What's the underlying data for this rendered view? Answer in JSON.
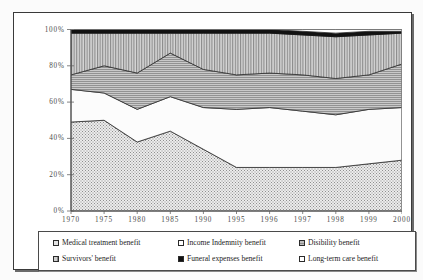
{
  "chart_data": {
    "type": "area",
    "stacked": true,
    "stack_mode": "percent",
    "title": "",
    "xlabel": "",
    "ylabel": "",
    "grid": false,
    "legend_position": "bottom",
    "ylim": [
      0,
      100
    ],
    "ytick_labels": [
      "100%",
      "80%",
      "60%",
      "40%",
      "20%",
      "0%"
    ],
    "ytick_values": [
      100,
      80,
      60,
      40,
      20,
      0
    ],
    "categories": [
      "1970",
      "1975",
      "1980",
      "1985",
      "1990",
      "1995",
      "1996",
      "1997",
      "1998",
      "1999",
      "2000"
    ],
    "series": [
      {
        "name": "Medical treatment benefit",
        "pattern": "fine-dot",
        "color": "#e6e6e6",
        "values": [
          49,
          50,
          38,
          44,
          34,
          24,
          24,
          24,
          24,
          26,
          28
        ]
      },
      {
        "name": "Income Indemnity benefit",
        "pattern": "solid-white",
        "color": "#fbfbfb",
        "values": [
          18,
          15,
          18,
          19,
          23,
          32,
          33,
          31,
          29,
          30,
          29
        ]
      },
      {
        "name": "Disibility benefit",
        "pattern": "horizontal-lines",
        "color": "#b8b8b8",
        "values": [
          8,
          15,
          20,
          24,
          21,
          19,
          19,
          20,
          20,
          19,
          24
        ]
      },
      {
        "name": "Survivors' benefit",
        "pattern": "vertical-lines",
        "color": "#cccccc",
        "values": [
          23,
          18,
          22,
          11,
          20,
          23,
          22,
          22,
          23,
          22,
          17
        ]
      },
      {
        "name": "Funeral expenses benefit",
        "pattern": "solid-black",
        "color": "#121212",
        "values": [
          2,
          2,
          2,
          2,
          2,
          2,
          2,
          2,
          2,
          2,
          1
        ]
      },
      {
        "name": "Long-term care benefit",
        "pattern": "solid-white",
        "color": "#ffffff",
        "values": [
          0,
          0,
          0,
          0,
          0,
          0,
          0,
          1,
          2,
          1,
          1
        ]
      }
    ]
  },
  "legend": {
    "rows": [
      [
        {
          "label": "Medical treatment benefit",
          "swatch": "sw-medical",
          "icon": "legend-swatch-medical"
        },
        {
          "label": "Income Indemnity benefit",
          "swatch": "sw-income",
          "icon": "legend-swatch-income"
        },
        {
          "label": "Disibility benefit",
          "swatch": "sw-disability",
          "icon": "legend-swatch-disability"
        }
      ],
      [
        {
          "label": "Survivors' benefit",
          "swatch": "sw-survivors",
          "icon": "legend-swatch-survivors"
        },
        {
          "label": "Funeral expenses benefit",
          "swatch": "sw-funeral",
          "icon": "legend-swatch-funeral"
        },
        {
          "label": "Long-term care benefit",
          "swatch": "sw-longterm",
          "icon": "legend-swatch-longterm"
        }
      ]
    ]
  }
}
